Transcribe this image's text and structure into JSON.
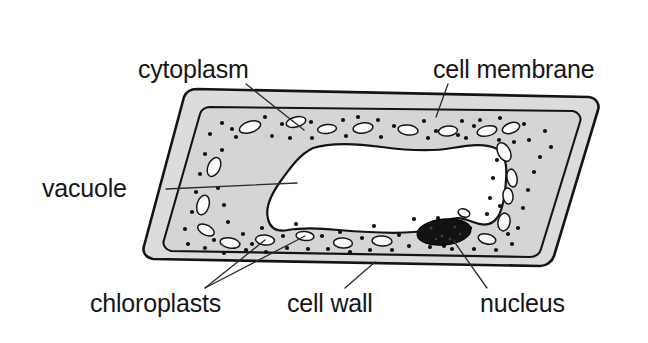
{
  "diagram": {
    "background_color": "#ffffff",
    "line_color": "#141414",
    "cell_wall_fill": "#dcdcdc",
    "cytoplasm_fill": "#d5d5d5",
    "vacuole_fill": "#ffffff",
    "nucleus_fill": "#121212",
    "chloroplast_fill": "#fbfbfb"
  },
  "labels": {
    "cytoplasm": {
      "text": "cytoplasm",
      "x": 138,
      "y": 78,
      "anchor": "start",
      "leader": "M 246 84 L 304 130"
    },
    "cell_membrane": {
      "text": "cell membrane",
      "x": 433,
      "y": 78,
      "anchor": "start",
      "leader": "M 448 84 L 436 117"
    },
    "vacuole": {
      "text": "vacuole",
      "x": 42,
      "y": 197,
      "anchor": "start",
      "leader": "M 166 189 L 297 183"
    },
    "chloroplasts": {
      "text": "chloroplasts",
      "x": 90,
      "y": 312,
      "anchor": "start",
      "leader_a": "M 205 288 L 265 240",
      "leader_b": "M 205 288 L 305 236"
    },
    "cell_wall": {
      "text": "cell wall",
      "x": 287,
      "y": 312,
      "anchor": "start",
      "leader": "M 345 288 L 375 262"
    },
    "nucleus": {
      "text": "nucleus",
      "x": 480,
      "y": 312,
      "anchor": "start",
      "leader": "M 487 288 L 453 240"
    }
  },
  "structures": {
    "cell_wall": {
      "name": "cell wall",
      "description": "outer rounded rhomboid band"
    },
    "cell_membrane": {
      "name": "cell membrane",
      "description": "inner line bounding the cytoplasm"
    },
    "cytoplasm": {
      "name": "cytoplasm",
      "description": "stippled grey region between membrane and vacuole"
    },
    "vacuole": {
      "name": "vacuole",
      "description": "large central white space"
    },
    "nucleus": {
      "name": "nucleus",
      "description": "dark stippled ellipse, lower right of cytoplasm",
      "cx": 444,
      "cy": 232,
      "rx": 27,
      "ry": 13,
      "rotation": -6
    },
    "chloroplasts": {
      "name": "chloroplasts",
      "description": "small white lens-shaped ovals within the cytoplasm",
      "count": 22,
      "ellipses": [
        {
          "cx": 250,
          "cy": 127,
          "rx": 11,
          "ry": 5.5,
          "rot": -18
        },
        {
          "cx": 296,
          "cy": 122,
          "rx": 10,
          "ry": 5,
          "rot": -14
        },
        {
          "cx": 327,
          "cy": 129,
          "rx": 9.5,
          "ry": 4.5,
          "rot": -6
        },
        {
          "cx": 363,
          "cy": 128,
          "rx": 10,
          "ry": 5,
          "rot": -8
        },
        {
          "cx": 408,
          "cy": 130,
          "rx": 10,
          "ry": 5,
          "rot": 7
        },
        {
          "cx": 448,
          "cy": 131,
          "rx": 9.5,
          "ry": 5,
          "rot": -5
        },
        {
          "cx": 487,
          "cy": 131,
          "rx": 10,
          "ry": 5,
          "rot": -12
        },
        {
          "cx": 511,
          "cy": 128,
          "rx": 9,
          "ry": 5,
          "rot": -20
        },
        {
          "cx": 214,
          "cy": 167,
          "rx": 6,
          "ry": 10,
          "rot": 24
        },
        {
          "cx": 203,
          "cy": 205,
          "rx": 6,
          "ry": 10,
          "rot": 16
        },
        {
          "cx": 206,
          "cy": 230,
          "rx": 9,
          "ry": 5,
          "rot": 28
        },
        {
          "cx": 230,
          "cy": 243,
          "rx": 10,
          "ry": 5,
          "rot": 10
        },
        {
          "cx": 265,
          "cy": 240,
          "rx": 9.5,
          "ry": 5,
          "rot": 5
        },
        {
          "cx": 305,
          "cy": 236,
          "rx": 9,
          "ry": 4.5,
          "rot": 6
        },
        {
          "cx": 343,
          "cy": 243,
          "rx": 9.5,
          "ry": 5,
          "rot": 4
        },
        {
          "cx": 382,
          "cy": 241,
          "rx": 10,
          "ry": 5,
          "rot": 3
        },
        {
          "cx": 504,
          "cy": 152,
          "rx": 6,
          "ry": 10,
          "rot": -28
        },
        {
          "cx": 512,
          "cy": 178,
          "rx": 5,
          "ry": 9,
          "rot": -10
        },
        {
          "cx": 508,
          "cy": 196,
          "rx": 5,
          "ry": 8,
          "rot": -6
        },
        {
          "cx": 504,
          "cy": 222,
          "rx": 6,
          "ry": 9,
          "rot": 10
        },
        {
          "cx": 487,
          "cy": 239,
          "rx": 9,
          "ry": 5,
          "rot": 14
        },
        {
          "cx": 464,
          "cy": 213,
          "rx": 6,
          "ry": 4,
          "rot": 20
        }
      ]
    },
    "granules": {
      "name": "cytoplasmic granules",
      "description": "small black dots stippled through the cytoplasm",
      "count": 86
    }
  }
}
